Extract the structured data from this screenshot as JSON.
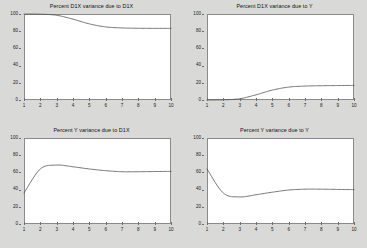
{
  "figure": {
    "background_color": "#d9d9d7",
    "plot_background_color": "#ffffff",
    "line_color": "#4a4a4a",
    "axis_color": "#8a8a8a"
  },
  "panels": [
    {
      "title": "Percent D1X variance due to D1X"
    },
    {
      "title": "Percent D1X variance due to Y"
    },
    {
      "title": "Percent Y variance due to D1X"
    },
    {
      "title": "Percent Y variance due to Y"
    }
  ],
  "axes": {
    "ytick_labels": [
      "100",
      "80",
      "60",
      "40",
      "20",
      "0"
    ],
    "ytick_values": [
      100,
      80,
      60,
      40,
      20,
      0
    ],
    "xtick_labels": [
      "1",
      "2",
      "3",
      "4",
      "5",
      "6",
      "7",
      "8",
      "9",
      "10"
    ],
    "xtick_values": [
      1,
      2,
      3,
      4,
      5,
      6,
      7,
      8,
      9,
      10
    ]
  },
  "chart_data": [
    {
      "type": "line",
      "title": "Percent D1X variance due to D1X",
      "xlabel": "",
      "ylabel": "",
      "xlim": [
        1,
        10
      ],
      "ylim": [
        0,
        100
      ],
      "grid": false,
      "legend": "none",
      "x": [
        1,
        2,
        3,
        4,
        5,
        6,
        7,
        8,
        9,
        10
      ],
      "values": [
        100.0,
        99.8,
        98.5,
        94.0,
        88.5,
        85.0,
        83.8,
        83.4,
        83.3,
        83.3
      ]
    },
    {
      "type": "line",
      "title": "Percent D1X variance due to Y",
      "xlabel": "",
      "ylabel": "",
      "xlim": [
        1,
        10
      ],
      "ylim": [
        0,
        100
      ],
      "grid": false,
      "legend": "none",
      "x": [
        1,
        2,
        3,
        4,
        5,
        6,
        7,
        8,
        9,
        10
      ],
      "values": [
        0.0,
        0.2,
        1.5,
        6.0,
        11.5,
        15.0,
        16.2,
        16.6,
        16.8,
        17.0
      ]
    },
    {
      "type": "line",
      "title": "Percent Y variance due to D1X",
      "xlabel": "",
      "ylabel": "",
      "xlim": [
        1,
        10
      ],
      "ylim": [
        0,
        100
      ],
      "grid": false,
      "legend": "none",
      "x": [
        1,
        2,
        3,
        4,
        5,
        6,
        7,
        8,
        9,
        10
      ],
      "values": [
        36.0,
        64.0,
        68.5,
        66.5,
        64.0,
        62.0,
        60.8,
        60.8,
        61.0,
        61.2
      ]
    },
    {
      "type": "line",
      "title": "Percent Y variance due to Y",
      "xlabel": "",
      "ylabel": "",
      "xlim": [
        1,
        10
      ],
      "ylim": [
        0,
        100
      ],
      "grid": false,
      "legend": "none",
      "x": [
        1,
        2,
        3,
        4,
        5,
        6,
        7,
        8,
        9,
        10
      ],
      "values": [
        64.0,
        36.0,
        31.5,
        34.0,
        37.0,
        39.5,
        40.5,
        40.5,
        40.2,
        40.0
      ]
    }
  ]
}
